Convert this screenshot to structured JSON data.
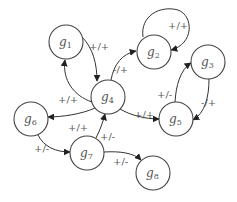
{
  "diagram": {
    "type": "directed-graph",
    "nodes": [
      {
        "id": "g1",
        "base": "g",
        "sub": "1",
        "cx": 66,
        "cy": 42
      },
      {
        "id": "g2",
        "base": "g",
        "sub": "2",
        "cx": 154,
        "cy": 52
      },
      {
        "id": "g3",
        "base": "g",
        "sub": "3",
        "cx": 208,
        "cy": 62
      },
      {
        "id": "g4",
        "base": "g",
        "sub": "4",
        "cx": 108,
        "cy": 97
      },
      {
        "id": "g5",
        "base": "g",
        "sub": "5",
        "cx": 176,
        "cy": 119
      },
      {
        "id": "g6",
        "base": "g",
        "sub": "6",
        "cx": 31,
        "cy": 119
      },
      {
        "id": "g7",
        "base": "g",
        "sub": "7",
        "cx": 87,
        "cy": 153
      },
      {
        "id": "g8",
        "base": "g",
        "sub": "8",
        "cx": 153,
        "cy": 173
      }
    ],
    "edges": [
      {
        "from": "g1",
        "to": "g4",
        "label": "+/+"
      },
      {
        "from": "g4",
        "to": "g1",
        "label": "+/+"
      },
      {
        "from": "g4",
        "to": "g2",
        "label": "-/+"
      },
      {
        "from": "g2",
        "to": "g2",
        "label": "+/+"
      },
      {
        "from": "g5",
        "to": "g3",
        "label": "+/-"
      },
      {
        "from": "g3",
        "to": "g5",
        "label": "-/+"
      },
      {
        "from": "g4",
        "to": "g5",
        "label": "+/+"
      },
      {
        "from": "g4",
        "to": "g6",
        "label": "+/+"
      },
      {
        "from": "g6",
        "to": "g7",
        "label": "+/-"
      },
      {
        "from": "g7",
        "to": "g4",
        "label": "+/-"
      },
      {
        "from": "g7",
        "to": "g8",
        "label": "+/-"
      }
    ]
  }
}
